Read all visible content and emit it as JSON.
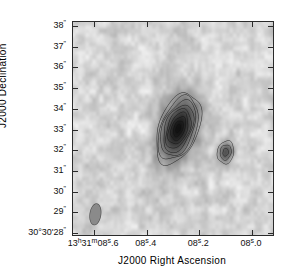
{
  "figure": {
    "title": "",
    "type": "radio-interferometry-greyscale-contour-map"
  },
  "axes": {
    "x_title": "J2000 Right Ascension",
    "y_title": "J2000 Declination",
    "x_tick_labels": [
      {
        "value": 8.6,
        "text_main": "13",
        "sup1": "h",
        "mid": "31",
        "sup2": "m",
        "sec": "08",
        "sup3": "s",
        "frac": ".6",
        "full": "13h31m08s.6"
      },
      {
        "value": 8.4,
        "text_main": "",
        "sup1": "",
        "mid": "",
        "sup2": "",
        "sec": "08",
        "sup3": "s",
        "frac": ".4",
        "full": "08s.4"
      },
      {
        "value": 8.2,
        "text_main": "",
        "sup1": "",
        "mid": "",
        "sup2": "",
        "sec": "08",
        "sup3": "s",
        "frac": ".2",
        "full": "08s.2"
      },
      {
        "value": 8.0,
        "text_main": "",
        "sup1": "",
        "mid": "",
        "sup2": "",
        "sec": "08",
        "sup3": "s",
        "frac": ".0",
        "full": "08s.0"
      }
    ],
    "y_tick_labels": [
      {
        "value": 38,
        "text": "38",
        "unit": "\"",
        "prefix": ""
      },
      {
        "value": 37,
        "text": "37",
        "unit": "\"",
        "prefix": ""
      },
      {
        "value": 36,
        "text": "36",
        "unit": "\"",
        "prefix": ""
      },
      {
        "value": 35,
        "text": "35",
        "unit": "\"",
        "prefix": ""
      },
      {
        "value": 34,
        "text": "34",
        "unit": "\"",
        "prefix": ""
      },
      {
        "value": 33,
        "text": "33",
        "unit": "\"",
        "prefix": ""
      },
      {
        "value": 32,
        "text": "32",
        "unit": "\"",
        "prefix": ""
      },
      {
        "value": 31,
        "text": "31",
        "unit": "\"",
        "prefix": ""
      },
      {
        "value": 30,
        "text": "30",
        "unit": "\"",
        "prefix": ""
      },
      {
        "value": 29,
        "text": "29",
        "unit": "\"",
        "prefix": ""
      },
      {
        "value": 28,
        "text": "30°30'28",
        "unit": "\"",
        "prefix": "30°30'"
      }
    ]
  },
  "chart_data": {
    "type": "heatmap",
    "title": "",
    "xlabel": "J2000 Right Ascension",
    "ylabel": "J2000 Declination",
    "grid": false,
    "legend": "none",
    "colormap": "greyscale-inverted",
    "xlim": [
      8.68,
      7.92
    ],
    "ylim": [
      27.85,
      38.15
    ],
    "x_unit": "seconds of time (RA, 13h31m)",
    "y_unit": "arcseconds (Dec, +30°30')",
    "x_ticks": [
      8.6,
      8.4,
      8.2,
      8.0
    ],
    "y_ticks": [
      28,
      29,
      30,
      31,
      32,
      33,
      34,
      35,
      36,
      37,
      38
    ],
    "x_tick_labels": [
      "13h31m08s.6",
      "08s.4",
      "08s.2",
      "08s.0"
    ],
    "y_tick_labels": [
      "30°30'28\"",
      "29\"",
      "30\"",
      "31\"",
      "32\"",
      "33\"",
      "34\"",
      "35\"",
      "36\"",
      "37\"",
      "38\""
    ],
    "x_direction": "reversed",
    "background": "mottled greyscale noise",
    "sources": [
      {
        "name": "primary-source",
        "x": 8.28,
        "y": 33.0,
        "peak_level": 1.0,
        "shape": "elongated-ellipse",
        "position_angle_deg": 20,
        "semi_major_arcsec": 1.35,
        "semi_minor_arcsec": 0.72,
        "contours": 9,
        "description": "bright extended source with nested elliptical contours"
      },
      {
        "name": "secondary-source",
        "x": 8.1,
        "y": 31.85,
        "peak_level": 0.45,
        "shape": "compact-ellipse",
        "position_angle_deg": 10,
        "semi_major_arcsec": 0.42,
        "semi_minor_arcsec": 0.3,
        "contours": 3,
        "description": "faint compact companion"
      }
    ],
    "beam": {
      "name": "restoring-beam",
      "x": 8.595,
      "y": 28.85,
      "semi_major_arcsec": 0.52,
      "semi_minor_arcsec": 0.27,
      "position_angle_deg": 8,
      "fill": "#8a8a8a"
    },
    "noise_rms_level": 0.06
  },
  "colors": {
    "frame": "#2b2b2b",
    "text": "#111111",
    "background": "#ffffff",
    "source_dark": "#1a1a1a",
    "beam_fill": "#8a8a8a"
  }
}
